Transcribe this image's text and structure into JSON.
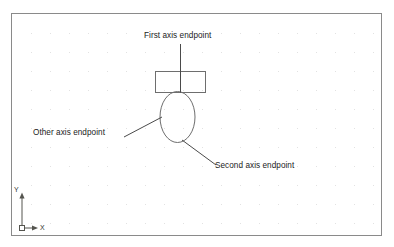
{
  "diagram": {
    "background_color": "#ffffff",
    "frame": {
      "name": "drawing-viewport",
      "border_color": "#8a8a8a",
      "x": 11,
      "y": 13,
      "width": 371,
      "height": 223
    },
    "grid": {
      "visible": true,
      "dot_color": "#e2e2e2",
      "spacing_x": 19,
      "spacing_y": 19
    },
    "shapes": [
      {
        "name": "rectangle",
        "type": "rect",
        "x": 155,
        "y": 71,
        "width": 50,
        "height": 21,
        "stroke": "#6e6e6e"
      },
      {
        "name": "ellipse",
        "type": "ellipse",
        "cx": 177.5,
        "cy": 117,
        "rx": 17.5,
        "ry": 25.5,
        "stroke": "#6e6e6e"
      }
    ],
    "callouts": [
      {
        "id": "first-axis-endpoint",
        "label": "First axis endpoint",
        "leader": {
          "x1": 180,
          "y1": 44,
          "x2": 180,
          "y2": 92
        }
      },
      {
        "id": "other-axis-endpoint",
        "label": "Other axis endpoint",
        "leader": {
          "x1": 124,
          "y1": 137,
          "x2": 162,
          "y2": 117
        }
      },
      {
        "id": "second-axis-endpoint",
        "label": "Second axis endpoint",
        "leader": {
          "x1": 216,
          "y1": 165,
          "x2": 182,
          "y2": 140
        }
      }
    ],
    "ucs_icon": {
      "name": "ucs-coordinate-icon",
      "x_axis_label": "X",
      "y_axis_label": "Y",
      "origin_x": 22,
      "origin_y": 228,
      "color": "#55554f"
    }
  },
  "colors": {
    "line": "#6e6e6e",
    "leader": "#4a4a4a",
    "text": "#1b1b1b",
    "grid_dot": "#e2e2e2",
    "frame": "#8a8a8a",
    "ucs": "#55554f"
  }
}
